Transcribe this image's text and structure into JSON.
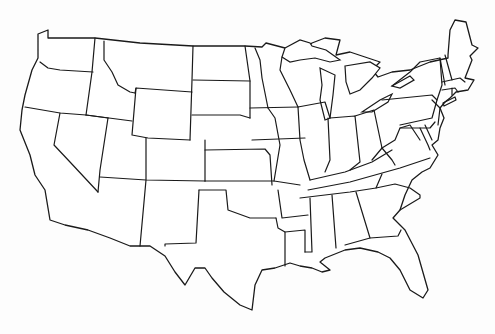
{
  "map": {
    "title": "",
    "description": "Blank outline map of the contiguous United States with state borders",
    "region": "Contiguous United States",
    "style": {
      "background": "#fdfdfd",
      "land_fill": "#ffffff",
      "border_color": "#1a1a1a"
    },
    "labels": [],
    "states": [
      "WA",
      "OR",
      "CA",
      "ID",
      "NV",
      "MT",
      "WY",
      "UT",
      "AZ",
      "CO",
      "NM",
      "ND",
      "SD",
      "NE",
      "KS",
      "OK",
      "TX",
      "MN",
      "IA",
      "MO",
      "AR",
      "LA",
      "WI",
      "IL",
      "MI",
      "IN",
      "OH",
      "KY",
      "TN",
      "MS",
      "AL",
      "GA",
      "FL",
      "SC",
      "NC",
      "VA",
      "WV",
      "PA",
      "NY",
      "VT",
      "NH",
      "ME",
      "MA",
      "CT",
      "RI",
      "NJ",
      "DE",
      "MD"
    ]
  }
}
